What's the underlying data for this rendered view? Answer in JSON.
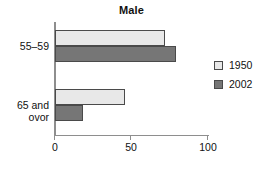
{
  "chart_data": {
    "type": "bar",
    "orientation": "horizontal",
    "title": "Male",
    "xlabel": "",
    "ylabel": "",
    "xlim": [
      0,
      100
    ],
    "xticks": [
      0,
      50,
      100
    ],
    "xtick_labels": [
      "0",
      "50",
      "100"
    ],
    "grid": false,
    "legend_position": "right",
    "categories": [
      "55–59",
      "65 and ovor"
    ],
    "category_lines": [
      [
        "55–59"
      ],
      [
        "65 and",
        "ovor"
      ]
    ],
    "series": [
      {
        "name": "1950",
        "values": [
          72,
          46
        ],
        "color": "#e8e8e8"
      },
      {
        "name": "2002",
        "values": [
          79,
          18
        ],
        "color": "#767676"
      }
    ]
  },
  "legend": {
    "items": [
      {
        "label": "1950",
        "swatch": "legend-swatch-1950"
      },
      {
        "label": "2002",
        "swatch": "legend-swatch-2002"
      }
    ]
  },
  "colors": {
    "series_1950": "#e8e8e8",
    "series_2002": "#767676",
    "bar_outline": "#4a4a4a",
    "axis": "#8e8e8e",
    "text": "#111111",
    "background": "#ffffff"
  }
}
